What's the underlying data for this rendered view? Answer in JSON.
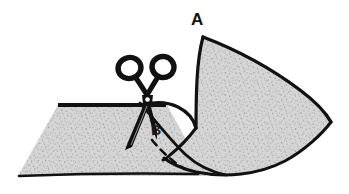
{
  "figure": {
    "kind": "line-drawing-illustration",
    "background_color": "#ffffff",
    "ink_color": "#111111",
    "fabric_fill_color": "#d2d2d2",
    "fabric_speckle_color": "#8f8f8f",
    "width": 349,
    "height": 194,
    "labels": [
      {
        "id": "a",
        "text": "A",
        "x": 197,
        "y": 20,
        "describes": "upper point of the fan-shaped fabric flap"
      },
      {
        "id": "b",
        "text": "B",
        "x": 157,
        "y": 130,
        "describes": "point at the scissor cut on the fold"
      }
    ],
    "shapes": {
      "lower_fabric_sheet": {
        "name": "lower-fabric-sheet",
        "description": "flat parallelogram sheet of fabric seen in perspective",
        "corners": [
          [
            58,
            105
          ],
          [
            167,
            105
          ],
          [
            205,
            175
          ],
          [
            18,
            175
          ]
        ]
      },
      "upper_fabric_flap": {
        "name": "upper-fabric-flap",
        "description": "fan / leaf shaped flap of fabric folded up to the right, point A at top, sharp point at right",
        "key_points": {
          "top_point": [
            203,
            37
          ],
          "right_point": [
            330,
            122
          ],
          "notch_point": [
            196,
            128
          ],
          "bottom_left": [
            166,
            171
          ]
        }
      },
      "scissors": {
        "name": "scissors",
        "description": "pair of scissors with two oval finger rings on top, pivot in middle, blades pointing down-left",
        "pivot": [
          146,
          100
        ],
        "ring_left_center": [
          130,
          68
        ],
        "ring_right_center": [
          162,
          68
        ],
        "blade_tip": [
          127,
          147
        ]
      },
      "cut_line": {
        "name": "dashed-cut-line",
        "description": "dashed guide line running down-right from B showing where the cut continues",
        "start": [
          156,
          140
        ],
        "end": [
          186,
          168
        ],
        "style": "dashed"
      }
    }
  }
}
